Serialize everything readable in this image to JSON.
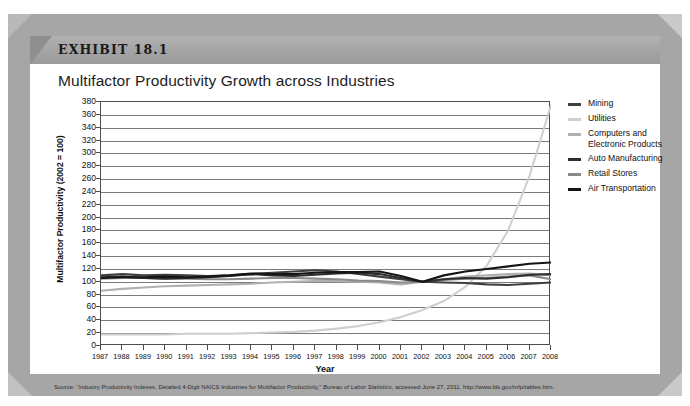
{
  "exhibit": {
    "label": "EXHIBIT 18.1",
    "title": "Multifactor Productivity Growth across Industries"
  },
  "source": {
    "prefix": "Source: “Industry Productivity Indexes, Detailed 4-Digit NAICS Industries for Multifactor Productivity,” ",
    "italic": "Bureau of Labor Statistics",
    "suffix": ", accessed June 27, 2011, http://www.bls.gov/mfp/tables.htm."
  },
  "colors": {
    "mining": "#3f3f3f",
    "utilities": "#cfcfcf",
    "computers": "#b0b0b0",
    "auto": "#2e2e2e",
    "retail": "#8a8a8a",
    "air": "#151515",
    "gridline": "#7a7a7a",
    "axis": "#4d4d4d",
    "banner": "#a3a3a3",
    "frame": "#a6a6a6"
  },
  "legend": {
    "position": "right",
    "items": [
      {
        "label": "Mining",
        "color_key": "mining"
      },
      {
        "label": "Utilities",
        "color_key": "utilities"
      },
      {
        "label": "Computers and\nElectronic Products",
        "color_key": "computers"
      },
      {
        "label": "Auto Manufacturing",
        "color_key": "auto"
      },
      {
        "label": "Retail Stores",
        "color_key": "retail"
      },
      {
        "label": "Air Transportation",
        "color_key": "air"
      }
    ]
  },
  "chart_data": {
    "type": "line",
    "title": "Multifactor Productivity Growth across Industries",
    "xlabel": "Year",
    "ylabel": "Multifactor Productivity (2002 = 100)",
    "xlim": [
      1987,
      2008
    ],
    "ylim": [
      0,
      380
    ],
    "ytick_step": 20,
    "grid": true,
    "legend_position": "right",
    "categories": [
      1987,
      1988,
      1989,
      1990,
      1991,
      1992,
      1993,
      1994,
      1995,
      1996,
      1997,
      1998,
      1999,
      2000,
      2001,
      2002,
      2003,
      2004,
      2005,
      2006,
      2007,
      2008
    ],
    "yticks": [
      0,
      20,
      40,
      60,
      80,
      100,
      120,
      140,
      160,
      180,
      200,
      220,
      240,
      260,
      280,
      300,
      320,
      340,
      360,
      380
    ],
    "xtick_labels": [
      "1987",
      "1988",
      "1989",
      "1990",
      "1991",
      "1992",
      "1993",
      "1994",
      "1995",
      "1996",
      "1997",
      "1998",
      "1999",
      "2000",
      "2001",
      "2002",
      "2003",
      "2004",
      "2005",
      "2006",
      "2007",
      "2008"
    ],
    "series": [
      {
        "name": "Mining",
        "color_key": "mining",
        "values": [
          110,
          112,
          110,
          111,
          110,
          109,
          110,
          112,
          114,
          116,
          118,
          116,
          112,
          108,
          104,
          100,
          99,
          98,
          96,
          95,
          97,
          99
        ]
      },
      {
        "name": "Utilities",
        "color_key": "utilities",
        "values": [
          18,
          18,
          18,
          18,
          19,
          19,
          19,
          20,
          21,
          22,
          24,
          27,
          31,
          37,
          45,
          56,
          70,
          92,
          125,
          180,
          265,
          375
        ]
      },
      {
        "name": "Computers and Electronic Products",
        "color_key": "computers",
        "values": [
          86,
          89,
          91,
          93,
          94,
          95,
          96,
          97,
          99,
          100,
          101,
          101,
          100,
          99,
          96,
          100,
          104,
          108,
          110,
          112,
          113,
          110
        ]
      },
      {
        "name": "Auto Manufacturing",
        "color_key": "auto",
        "values": [
          107,
          108,
          106,
          105,
          106,
          107,
          109,
          112,
          110,
          109,
          111,
          113,
          114,
          112,
          106,
          100,
          104,
          106,
          105,
          107,
          111,
          112
        ]
      },
      {
        "name": "Retail Stores",
        "color_key": "retail",
        "values": [
          105,
          106,
          106,
          105,
          105,
          104,
          104,
          105,
          106,
          106,
          105,
          104,
          102,
          101,
          99,
          100,
          103,
          105,
          106,
          108,
          110,
          104
        ]
      },
      {
        "name": "Air Transportation",
        "color_key": "air",
        "values": [
          106,
          107,
          107,
          108,
          107,
          108,
          110,
          113,
          112,
          112,
          114,
          115,
          115,
          116,
          109,
          100,
          110,
          116,
          120,
          124,
          128,
          130
        ]
      }
    ]
  }
}
